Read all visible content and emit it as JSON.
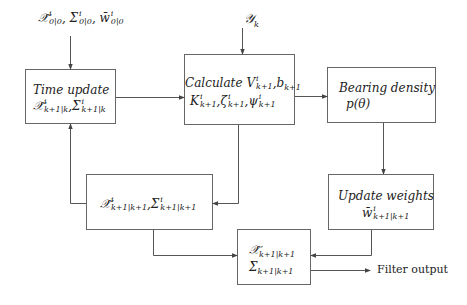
{
  "diagram": {
    "colors": {
      "line": "#555555",
      "box_border": "#666666",
      "text": "#222222",
      "background": "#ffffff"
    },
    "inputs": {
      "initial_state": {
        "base": "X̂, Σ, w̄",
        "parts": [
          {
            "sym": "𝒳̂",
            "sup": "i",
            "sub": "0|0"
          },
          {
            "sym": "Σ",
            "sup": "i",
            "sub": "0|0"
          },
          {
            "sym": "w̄",
            "sup": "i",
            "sub": "0|0"
          }
        ]
      },
      "measurement": {
        "sym": "𝒴",
        "sub": "k"
      }
    },
    "nodes": {
      "time_update": {
        "title": "Time update",
        "parts": [
          {
            "sym": "𝒳̂",
            "sup": "i",
            "sub": "k+1|k"
          },
          {
            "sym": "Σ",
            "sup": "i",
            "sub": "k+1|k"
          }
        ]
      },
      "calculate": {
        "title": "Calculate",
        "line1": [
          {
            "sym": "V",
            "sup": "i",
            "sub": "k+1"
          },
          {
            "sym": "b",
            "sup": "",
            "sub": "k+1"
          }
        ],
        "line2": [
          {
            "sym": "K",
            "sup": "i",
            "sub": "k+1"
          },
          {
            "sym": "ζ",
            "sup": "i",
            "sub": "k+1"
          },
          {
            "sym": "ψ",
            "sup": "i",
            "sub": "k+1"
          }
        ]
      },
      "bearing_density": {
        "title": "Bearing density",
        "expr": "p(θ)"
      },
      "update_weights": {
        "title": "Update weights",
        "parts": [
          {
            "sym": "w̄",
            "sup": "i",
            "sub": "k+1|k+1"
          }
        ]
      },
      "posterior": {
        "parts": [
          {
            "sym": "𝒳̂",
            "sup": "i",
            "sub": "k+1|k+1"
          },
          {
            "sym": "Σ",
            "sup": "i",
            "sub": "k+1|k+1"
          }
        ]
      },
      "output": {
        "line1": {
          "sym": "𝒳̂",
          "sub": "k+1|k+1"
        },
        "line2": {
          "sym": "Σ",
          "sub": "k+1|k+1"
        }
      }
    },
    "output_label": "Filter output",
    "separator": ","
  }
}
